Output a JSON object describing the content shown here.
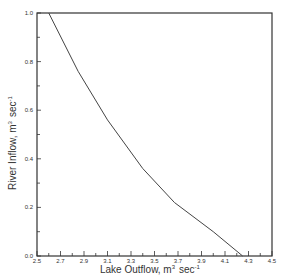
{
  "chart_data": {
    "type": "line",
    "title": "",
    "xlabel": "Lake Outflow, m³ sec⁻¹",
    "ylabel": "River Inflow, m³ sec⁻¹",
    "xlim": [
      2.5,
      4.5
    ],
    "ylim": [
      0.0,
      1.0
    ],
    "x_ticks": [
      "2.5",
      "2.7",
      "2.9",
      "3.1",
      "3.3",
      "3.5",
      "3.7",
      "3.9",
      "4.1",
      "4.3",
      "4.5"
    ],
    "y_ticks": [
      "0.0",
      "0.2",
      "0.4",
      "0.6",
      "0.8",
      "1.0"
    ],
    "grid": false,
    "legend": null,
    "series": [
      {
        "name": "River Inflow vs Lake Outflow",
        "x": [
          2.6,
          2.85,
          3.1,
          3.4,
          3.67,
          4.0,
          4.25
        ],
        "y": [
          1.0,
          0.76,
          0.56,
          0.36,
          0.22,
          0.1,
          0.0
        ]
      }
    ]
  },
  "labels": {
    "x_axis_main": "Lake Outflow,  m",
    "x_axis_sup": "3",
    "x_axis_unit": "sec",
    "x_axis_unit_sup": "-1",
    "y_axis_main": "River Inflow,  m",
    "y_axis_sup": "3",
    "y_axis_unit": "sec",
    "y_axis_unit_sup": "-1"
  }
}
